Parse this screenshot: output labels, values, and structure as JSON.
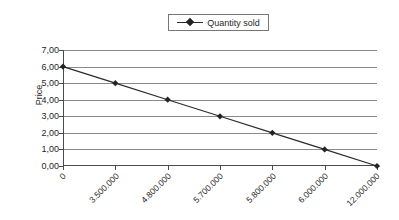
{
  "chart_data": {
    "type": "line",
    "title": "",
    "xlabel": "",
    "ylabel": "Price",
    "categories": [
      "0",
      "3.500.000",
      "4.800.000",
      "5.700.000",
      "5.800.000",
      "6.000.000",
      "12.000.000"
    ],
    "series": [
      {
        "name": "Quantity sold",
        "values": [
          6.0,
          5.0,
          4.0,
          3.0,
          2.0,
          1.0,
          0.0
        ]
      }
    ],
    "y_ticks": [
      "0,00",
      "1,00",
      "2,00",
      "3,00",
      "4,00",
      "5,00",
      "6,00",
      "7,00"
    ],
    "y_tick_values": [
      0,
      1,
      2,
      3,
      4,
      5,
      6,
      7
    ],
    "ylim": [
      0,
      7
    ],
    "grid": true,
    "legend_position": "top-center",
    "marker": "diamond",
    "colors": {
      "series_line": "#2b2b2b",
      "marker": "#242424",
      "gridline": "#8a8a8a",
      "axis": "#4a4a4a",
      "text": "#1f1f1f",
      "background": "#ffffff"
    }
  },
  "legend": {
    "entries": [
      {
        "label": "Quantity sold",
        "marker_icon": "diamond-marker-icon"
      }
    ]
  },
  "axes": {
    "y_title": "Price"
  }
}
